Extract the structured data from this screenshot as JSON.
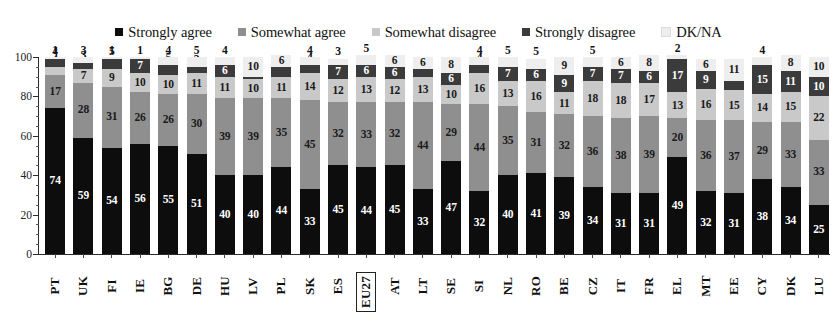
{
  "legend": {
    "items": [
      {
        "label": "Strongly agree",
        "key": "strongly_agree",
        "color": "#0d0d0d"
      },
      {
        "label": "Somewhat agree",
        "key": "somewhat_agree",
        "color": "#8f8f8f"
      },
      {
        "label": "Somewhat disagree",
        "key": "somewhat_disagree",
        "color": "#c9c9c9"
      },
      {
        "label": "Strongly disagree",
        "key": "strongly_disagree",
        "color": "#3b3b3b"
      },
      {
        "label": "DK/NA",
        "key": "dk_na",
        "color": "#eeeeee"
      }
    ]
  },
  "axis": {
    "y_ticks": [
      "0",
      "20",
      "40",
      "60",
      "80",
      "100"
    ],
    "y_min": 0,
    "y_max": 100
  },
  "chart_data": {
    "type": "bar",
    "subtype": "stacked-percentage-column",
    "title": "",
    "subtitle": "",
    "xlabel": "",
    "ylabel": "",
    "ylim": [
      0,
      100
    ],
    "grid": false,
    "legend_position": "top-center",
    "highlighted_category": "EU27",
    "categories": [
      "PT",
      "UK",
      "FI",
      "IE",
      "BG",
      "DE",
      "HU",
      "LV",
      "PL",
      "SK",
      "ES",
      "EU27",
      "AT",
      "LT",
      "SE",
      "SI",
      "NL",
      "RO",
      "BE",
      "CZ",
      "IT",
      "FR",
      "EL",
      "MT",
      "EE",
      "CY",
      "DK",
      "LU"
    ],
    "series": [
      {
        "name": "Strongly agree",
        "color": "#0d0d0d",
        "values": [
          74,
          59,
          54,
          56,
          55,
          51,
          40,
          40,
          44,
          33,
          45,
          44,
          45,
          33,
          47,
          32,
          40,
          41,
          39,
          34,
          31,
          31,
          49,
          32,
          31,
          38,
          34,
          25
        ]
      },
      {
        "name": "Somewhat agree",
        "color": "#8f8f8f",
        "values": [
          17,
          28,
          31,
          26,
          26,
          30,
          39,
          39,
          35,
          45,
          32,
          33,
          32,
          44,
          29,
          44,
          35,
          31,
          32,
          36,
          38,
          39,
          20,
          36,
          37,
          29,
          33,
          33
        ]
      },
      {
        "name": "Somewhat disagree",
        "color": "#c9c9c9",
        "values": [
          4,
          7,
          9,
          10,
          10,
          11,
          11,
          10,
          11,
          14,
          12,
          13,
          12,
          13,
          10,
          16,
          13,
          16,
          11,
          18,
          18,
          17,
          13,
          16,
          15,
          14,
          15,
          22
        ]
      },
      {
        "name": "Strongly disagree",
        "color": "#3b3b3b",
        "values": [
          4,
          3,
          5,
          7,
          5,
          3,
          6,
          1,
          5,
          4,
          7,
          6,
          6,
          4,
          6,
          4,
          7,
          6,
          9,
          7,
          7,
          6,
          17,
          9,
          5,
          15,
          11,
          10
        ]
      },
      {
        "name": "DK/NA",
        "color": "#eeeeee",
        "values": [
          1,
          3,
          1,
          1,
          4,
          5,
          4,
          10,
          6,
          4,
          3,
          5,
          6,
          6,
          8,
          4,
          5,
          5,
          9,
          5,
          6,
          8,
          2,
          6,
          11,
          4,
          8,
          10
        ]
      }
    ]
  }
}
